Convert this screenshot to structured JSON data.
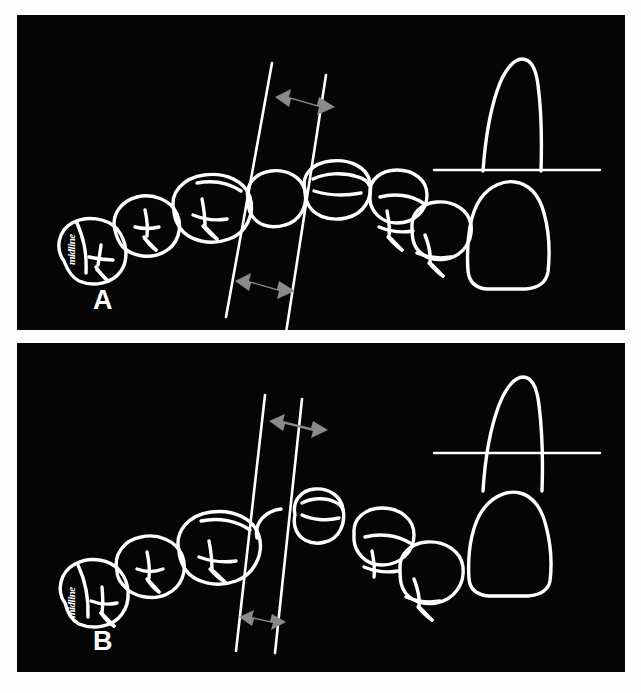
{
  "figure": {
    "background_color": "#fdfdfd",
    "panel_background_color": "#050505",
    "line_color": "#ffffff",
    "arrow_color": "#8a8a8a",
    "panels": [
      {
        "letter": "A",
        "handwritten_label": "midline",
        "description": "Occlusal view of maxillary dental arch with two parallel guidelines bracketing a wide central incisor, plus a labial tooth profile with a horizontal reference line at the cervical level",
        "guidelines": {
          "count": 2,
          "orientation": "near-vertical, tilted",
          "left_line": {
            "x_top": 272,
            "y_top": 63,
            "x_bottom": 226,
            "y_bottom": 317
          },
          "right_line": {
            "x_top": 326,
            "y_top": 75,
            "x_bottom": 286,
            "y_bottom": 333
          }
        },
        "arrows": [
          {
            "name": "upper-width-arrow",
            "double_headed": true,
            "x1": 276,
            "y1": 97,
            "x2": 320,
            "y2": 113
          },
          {
            "name": "lower-width-arrow",
            "double_headed": true,
            "x1": 236,
            "y1": 282,
            "x2": 280,
            "y2": 296
          }
        ],
        "tooth_profile": {
          "name": "incisor-profile",
          "reference_line": {
            "x1": 434,
            "y1": 170,
            "x2": 600,
            "y2": 170
          },
          "reference_line_position": "at cervical line / crown-root junction"
        }
      },
      {
        "letter": "B",
        "handwritten_label": "midline",
        "description": "Occlusal view of maxillary dental arch with two parallel guidelines bracketing a narrow central incisor, plus a labial tooth profile with the horizontal reference line higher on the root",
        "guidelines": {
          "count": 2,
          "orientation": "near-vertical, tilted",
          "left_line": {
            "x_top": 265,
            "y_top": 398,
            "x_bottom": 236,
            "y_bottom": 648
          },
          "right_line": {
            "x_top": 302,
            "y_top": 402,
            "x_bottom": 275,
            "y_bottom": 650
          }
        },
        "arrows": [
          {
            "name": "upper-width-arrow",
            "double_headed": true,
            "x1": 271,
            "y1": 423,
            "x2": 313,
            "y2": 432
          },
          {
            "name": "lower-width-arrow",
            "double_headed": true,
            "x1": 240,
            "y1": 620,
            "x2": 272,
            "y2": 628
          }
        ],
        "tooth_profile": {
          "name": "incisor-profile",
          "reference_line": {
            "x1": 434,
            "y1": 452,
            "x2": 600,
            "y2": 452
          },
          "reference_line_position": "above cervical line, crossing the root"
        }
      }
    ]
  }
}
